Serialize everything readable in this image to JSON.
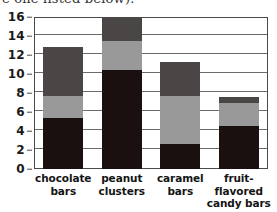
{
  "heading": {
    "clipped_text": "e one listed below)."
  },
  "chart_data": {
    "type": "bar",
    "subtype": "stacked-bar",
    "title": "",
    "xlabel": "",
    "ylabel": "",
    "ylim": [
      0,
      16
    ],
    "yticks": [
      0,
      2,
      4,
      6,
      8,
      10,
      12,
      14,
      16
    ],
    "ytick_labels": [
      "0",
      "2",
      "4",
      "6",
      "8",
      "10",
      "12",
      "14",
      "16"
    ],
    "grid": true,
    "grid_axis": "y",
    "legend": false,
    "legend_position": "none",
    "categories": [
      "chocolate bars",
      "peanut clusters",
      "caramel bars",
      "fruit-flavored candy bars"
    ],
    "category_lines": [
      [
        "chocolate",
        "bars"
      ],
      [
        "peanut",
        "clusters"
      ],
      [
        "caramel",
        "bars"
      ],
      [
        "fruit-flavored",
        "candy bars"
      ]
    ],
    "series": [
      {
        "name": "bottom-segment",
        "color": "#1a1010",
        "values": [
          5.4,
          10.4,
          2.6,
          4.5
        ]
      },
      {
        "name": "middle-segment",
        "color": "#999999",
        "values": [
          2.3,
          3.1,
          5.1,
          2.4
        ]
      },
      {
        "name": "top-segment",
        "color": "#4a4646",
        "values": [
          5.1,
          2.5,
          3.6,
          0.7
        ]
      }
    ],
    "totals": [
      12.8,
      16.0,
      11.3,
      7.6
    ],
    "colors": {
      "bottom": "#1a1010",
      "middle": "#999999",
      "top": "#4a4646",
      "axis": "#4a4a4a",
      "grid": "#6b6b6b",
      "background": "#ffffff",
      "text": "#141414"
    }
  }
}
